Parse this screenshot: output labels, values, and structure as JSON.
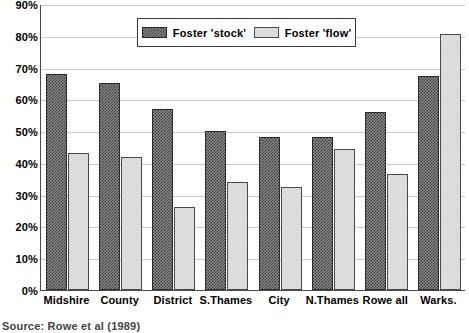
{
  "chart_data": {
    "type": "bar",
    "title": "",
    "xlabel": "",
    "ylabel": "",
    "ylim": [
      0,
      90
    ],
    "grid": true,
    "legend_position": "top-center",
    "categories": [
      "Midshire",
      "County",
      "District",
      "S.Thames",
      "City",
      "N.Thames",
      "Rowe all",
      "Warks."
    ],
    "ytick_labels": [
      "90%",
      "80%",
      "70%",
      "60%",
      "50%",
      "40%",
      "30%",
      "20%",
      "10%",
      "0%"
    ],
    "ytick_values": [
      90,
      80,
      70,
      60,
      50,
      40,
      30,
      20,
      10,
      0
    ],
    "series": [
      {
        "name": "Foster 'stock'",
        "values": [
          68,
          65,
          57,
          50,
          48,
          48,
          56,
          67.5
        ]
      },
      {
        "name": "Foster 'flow'",
        "values": [
          43,
          42,
          26,
          34,
          32.5,
          44.5,
          36.5,
          80.5
        ]
      }
    ]
  },
  "legend": {
    "entries": [
      {
        "label": "Foster 'stock'",
        "swatch": "dark-checker-swatch"
      },
      {
        "label": "Foster 'flow'",
        "swatch": "light-gray-swatch"
      }
    ]
  },
  "source_note": "Source: Rowe et al (1989)",
  "colors": {
    "stock_fill": "#8a8a8a",
    "stock_pattern": "#3a3a3a",
    "flow_fill": "#e2e2e2",
    "flow_pattern": "#d2d2d2",
    "gridline": "#c9c9c9",
    "axis": "#4a4a4a",
    "text": "#000000"
  }
}
